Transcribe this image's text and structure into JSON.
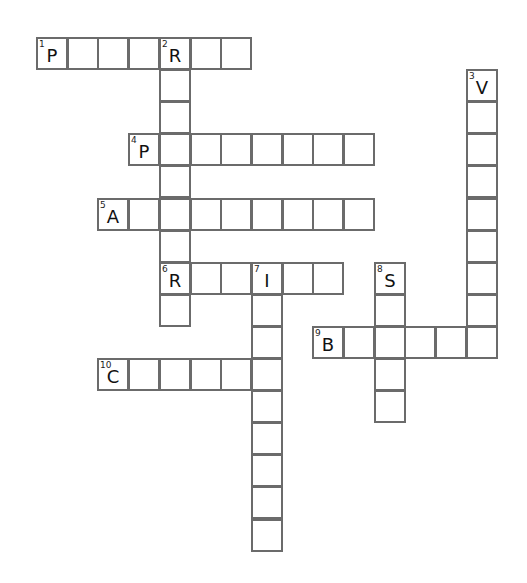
{
  "puzzle": {
    "type": "crossword",
    "layout": {
      "col_origin": 36,
      "row_origin": 37,
      "col_pitch": 30.7,
      "row_pitch": 32.1,
      "border_color": "#6b6b6b"
    },
    "entries": [
      {
        "number": 1,
        "direction": "across",
        "row": 0,
        "col": 0,
        "length": 7,
        "first_letter": "P"
      },
      {
        "number": 2,
        "direction": "down",
        "row": 0,
        "col": 4,
        "length": 9,
        "first_letter": "R"
      },
      {
        "number": 3,
        "direction": "down",
        "row": 1,
        "col": 14,
        "length": 9,
        "first_letter": "V"
      },
      {
        "number": 4,
        "direction": "across",
        "row": 3,
        "col": 3,
        "length": 8,
        "first_letter": "P"
      },
      {
        "number": 5,
        "direction": "across",
        "row": 5,
        "col": 2,
        "length": 9,
        "first_letter": "A"
      },
      {
        "number": 6,
        "direction": "across",
        "row": 7,
        "col": 4,
        "length": 6,
        "first_letter": "R"
      },
      {
        "number": 7,
        "direction": "down",
        "row": 7,
        "col": 7,
        "length": 9,
        "first_letter": "I"
      },
      {
        "number": 8,
        "direction": "down",
        "row": 7,
        "col": 11,
        "length": 5,
        "first_letter": "S"
      },
      {
        "number": 9,
        "direction": "across",
        "row": 9,
        "col": 9,
        "length": 6,
        "first_letter": "B"
      },
      {
        "number": 10,
        "direction": "across",
        "row": 10,
        "col": 2,
        "length": 6,
        "first_letter": "C"
      }
    ]
  }
}
